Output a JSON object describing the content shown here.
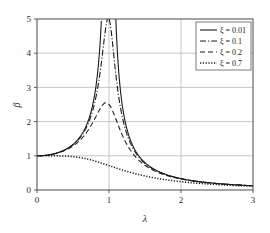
{
  "chart_data": {
    "type": "line",
    "title": "",
    "xlabel": "λ",
    "ylabel": "β",
    "xlim": [
      0,
      3
    ],
    "ylim": [
      0,
      5
    ],
    "xticks": [
      "0",
      "1",
      "2",
      "3"
    ],
    "yticks": [
      "0",
      "1",
      "2",
      "3",
      "4",
      "5"
    ],
    "xtick_values": [
      0,
      1,
      2,
      3
    ],
    "ytick_values": [
      0,
      1,
      2,
      3,
      4,
      5
    ],
    "grid": true,
    "legend_position": "top-right",
    "formula": "beta = 1 / sqrt((1 - lambda^2)^2 + (2*zeta*lambda)^2)",
    "series": [
      {
        "name": "ξ = 0.01",
        "zeta": 0.01,
        "style": "solid",
        "color": "#1a1a1a",
        "peak_value": 50.0,
        "peak_x": 1.0,
        "clipped_at": 5,
        "x": [
          0,
          0.2,
          0.4,
          0.5,
          0.6,
          0.7,
          0.8,
          0.85,
          0.9,
          0.95,
          0.98,
          1.0,
          1.02,
          1.05,
          1.1,
          1.15,
          1.2,
          1.3,
          1.5,
          1.8,
          2.0,
          2.5,
          3.0
        ],
        "values": [
          1.0,
          1.042,
          1.19,
          1.333,
          1.562,
          1.96,
          2.777,
          3.6,
          5.26,
          10.2,
          24.8,
          50.0,
          24.4,
          9.8,
          4.76,
          3.1,
          2.27,
          1.44,
          0.8,
          1.0,
          0.333,
          0.19,
          0.125
        ]
      },
      {
        "name": "ξ = 0.1",
        "zeta": 0.1,
        "style": "dashdot",
        "color": "#1a1a1a",
        "peak_value": 5.025,
        "peak_x": 0.99,
        "clipped_at": 5,
        "x": [
          0,
          0.2,
          0.4,
          0.6,
          0.8,
          0.9,
          0.95,
          1.0,
          1.05,
          1.1,
          1.2,
          1.4,
          1.6,
          2.0,
          2.5,
          3.0
        ],
        "values": [
          1.0,
          1.041,
          1.187,
          1.548,
          2.65,
          4.25,
          4.85,
          5.0,
          4.54,
          3.55,
          2.16,
          1.04,
          0.62,
          0.327,
          0.189,
          0.125
        ]
      },
      {
        "name": "ξ = 0.2",
        "zeta": 0.2,
        "style": "dashed",
        "color": "#1a1a1a",
        "peak_value": 2.55,
        "peak_x": 0.96,
        "clipped_at": null,
        "x": [
          0,
          0.2,
          0.4,
          0.6,
          0.8,
          0.9,
          0.96,
          1.0,
          1.1,
          1.2,
          1.4,
          1.6,
          2.0,
          2.5,
          3.0
        ],
        "values": [
          1.0,
          1.039,
          1.172,
          1.471,
          2.11,
          2.46,
          2.55,
          2.5,
          2.04,
          1.6,
          1.0,
          0.66,
          0.32,
          0.188,
          0.124
        ]
      },
      {
        "name": "ξ = 0.7",
        "zeta": 0.7,
        "style": "dotted",
        "color": "#1a1a1a",
        "peak_value": 1.0,
        "peak_x": 0.0,
        "clipped_at": null,
        "x": [
          0,
          0.2,
          0.4,
          0.6,
          0.8,
          1.0,
          1.2,
          1.4,
          1.6,
          1.8,
          2.0,
          2.5,
          3.0
        ],
        "values": [
          1.0,
          0.993,
          0.958,
          0.889,
          0.796,
          0.714,
          0.567,
          0.451,
          0.365,
          0.301,
          0.253,
          0.171,
          0.123
        ]
      }
    ]
  },
  "axes": {
    "x_title": "λ",
    "y_title": "β"
  },
  "legend": {
    "entries": [
      {
        "label": "ξ = 0.01",
        "style": "solid"
      },
      {
        "label": "ξ = 0.1",
        "style": "dashdot"
      },
      {
        "label": "ξ = 0.2",
        "style": "dashed"
      },
      {
        "label": "ξ = 0.7",
        "style": "dotted"
      }
    ]
  },
  "colors": {
    "curve": "#1a1a1a",
    "grid": "#b9b9b9",
    "axis": "#4a4a4a",
    "background": "#ffffff"
  }
}
